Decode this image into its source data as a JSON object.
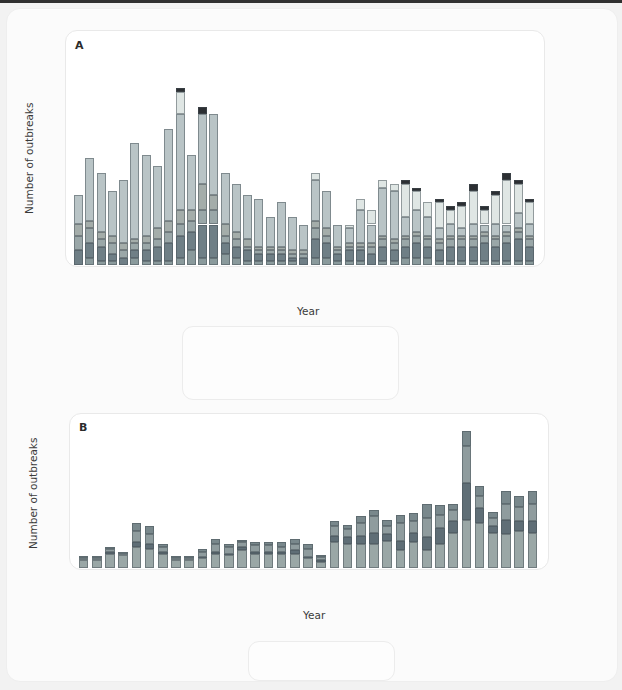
{
  "figure": {
    "background": "#f2f2f2",
    "panel_background": "#ffffff"
  },
  "panelA": {
    "letter": "A",
    "ylabel": "Number of outbreaks",
    "xlabel": "Year",
    "ytick_labels": [
      "0",
      "10",
      "20",
      "30",
      "40",
      "50",
      "60"
    ],
    "xtick_labels": [
      "1971",
      "1974",
      "1977",
      "1980",
      "1983",
      "1985",
      "1989",
      "1992",
      "1995",
      "1998",
      "2001",
      "2004",
      "2007",
      "2010"
    ],
    "legend": {
      "items": [
        {
          "label": "Parasitic",
          "color": "#8a9a9c",
          "italic": false
        },
        {
          "label": "Unidentified",
          "color": "#b9c4c6",
          "italic": false
        },
        {
          "label": "Bacterial",
          "color": "#6f7f86",
          "italic": false
        },
        {
          "label": "Legionella spp.",
          "color": "#dfe6e4",
          "italic": true
        },
        {
          "label": "Viral",
          "color": "#9aa7a8",
          "italic": false
        },
        {
          "label": "Multiple",
          "color": "#2c2f33",
          "italic": false
        },
        {
          "label": "Chemical",
          "color": "#a4adaa",
          "italic": false
        }
      ]
    }
  },
  "panelB": {
    "letter": "B",
    "ylabel": "Number of outbreaks",
    "xlabel": "Year",
    "ytick_labels": [
      "0",
      "10",
      "20",
      "30",
      "40",
      "50",
      "60",
      "70",
      "80",
      "90"
    ],
    "xtick_labels": [
      "1978",
      "1980",
      "1982",
      "1984",
      "1986",
      "1988",
      "1990",
      "1992",
      "1994",
      "1996",
      "1998",
      "2000",
      "2002",
      "2004",
      "2006",
      "2008",
      "2010",
      "2012"
    ],
    "legend": {
      "items": [
        {
          "label": "AGI",
          "sup": "",
          "color": "#9aa7a6"
        },
        {
          "label": "Other",
          "sup": "",
          "color": "#8f9c9e"
        },
        {
          "label": "ARI",
          "sup": "†",
          "color": "#5f6e76"
        },
        {
          "label": "Skin",
          "sup": "",
          "color": "#79888c"
        }
      ]
    }
  },
  "chart_data": [
    {
      "type": "bar",
      "id": "panel-A",
      "title": "A",
      "stacked": true,
      "xlabel": "Year",
      "ylabel": "Number of outbreaks",
      "ylim": [
        0,
        60
      ],
      "yticks": [
        0,
        10,
        20,
        30,
        40,
        50,
        60
      ],
      "grid": false,
      "legend_position": "below-plot",
      "series": [
        {
          "name": "Parasitic",
          "color": "#8a9a9c"
        },
        {
          "name": "Bacterial",
          "color": "#6f7f86"
        },
        {
          "name": "Viral",
          "color": "#9aa7a8"
        },
        {
          "name": "Chemical",
          "color": "#a4adaa"
        },
        {
          "name": "Unidentified",
          "color": "#b9c4c6"
        },
        {
          "name": "Legionella spp.",
          "color": "#dfe6e4"
        },
        {
          "name": "Multiple",
          "color": "#2c2f33"
        }
      ],
      "categories": [
        "1971",
        "1972",
        "1973",
        "1974",
        "1975",
        "1976",
        "1977",
        "1978",
        "1979",
        "1980",
        "1981",
        "1982",
        "1983",
        "1984",
        "1985",
        "1986",
        "1987",
        "1988",
        "1989",
        "1990",
        "1991",
        "1992",
        "1993",
        "1994",
        "1995",
        "1996",
        "1997",
        "1998",
        "1999",
        "2000",
        "2001",
        "2002",
        "2003",
        "2004",
        "2005",
        "2006",
        "2007",
        "2008",
        "2009",
        "2010",
        "2011"
      ],
      "stacks": {
        "Parasitic": [
          0,
          2,
          1,
          1,
          0,
          2,
          1,
          1,
          1,
          2,
          4,
          2,
          2,
          3,
          2,
          1,
          1,
          1,
          1,
          1,
          0,
          2,
          2,
          1,
          1,
          1,
          0,
          1,
          1,
          2,
          2,
          2,
          1,
          1,
          1,
          1,
          1,
          1,
          1,
          1,
          1
        ],
        "Bacterial": [
          4,
          4,
          4,
          2,
          2,
          2,
          3,
          4,
          5,
          6,
          5,
          9,
          9,
          3,
          3,
          3,
          2,
          2,
          2,
          1,
          2,
          5,
          4,
          2,
          3,
          3,
          3,
          4,
          3,
          3,
          4,
          3,
          3,
          4,
          4,
          4,
          5,
          4,
          5,
          6,
          4
        ],
        "Viral": [
          4,
          4,
          2,
          3,
          2,
          2,
          2,
          2,
          3,
          3,
          3,
          4,
          4,
          2,
          2,
          1,
          1,
          1,
          1,
          1,
          1,
          3,
          2,
          1,
          1,
          1,
          2,
          2,
          2,
          2,
          2,
          2,
          2,
          2,
          2,
          2,
          2,
          2,
          2,
          2,
          2
        ],
        "Chemical": [
          3,
          2,
          2,
          2,
          2,
          1,
          2,
          3,
          3,
          4,
          3,
          7,
          4,
          3,
          2,
          2,
          1,
          1,
          1,
          1,
          1,
          2,
          2,
          1,
          1,
          1,
          1,
          1,
          1,
          1,
          1,
          1,
          1,
          1,
          1,
          1,
          1,
          1,
          1,
          1,
          1
        ],
        "Unidentified": [
          8,
          17,
          16,
          12,
          17,
          26,
          22,
          17,
          25,
          26,
          15,
          19,
          22,
          14,
          13,
          12,
          13,
          8,
          12,
          9,
          7,
          11,
          10,
          6,
          4,
          9,
          5,
          13,
          13,
          5,
          6,
          5,
          3,
          3,
          2,
          3,
          2,
          3,
          2,
          4,
          3
        ],
        "Legionella spp.": [
          0,
          0,
          0,
          0,
          0,
          0,
          0,
          0,
          0,
          6,
          0,
          0,
          0,
          0,
          0,
          0,
          0,
          0,
          0,
          0,
          0,
          2,
          0,
          0,
          1,
          3,
          4,
          2,
          2,
          9,
          5,
          4,
          7,
          4,
          6,
          9,
          4,
          8,
          12,
          8,
          6
        ],
        "Multiple": [
          0,
          0,
          0,
          0,
          0,
          0,
          0,
          0,
          0,
          1,
          0,
          2,
          0,
          0,
          0,
          0,
          0,
          0,
          0,
          0,
          0,
          0,
          0,
          0,
          0,
          0,
          0,
          0,
          0,
          1,
          1,
          0,
          1,
          1,
          1,
          2,
          1,
          1,
          2,
          1,
          1
        ]
      },
      "totals": [
        19,
        29,
        25,
        20,
        23,
        33,
        30,
        27,
        37,
        48,
        30,
        43,
        41,
        25,
        22,
        19,
        18,
        14,
        16,
        15,
        11,
        25,
        20,
        11,
        11,
        18,
        15,
        23,
        22,
        23,
        21,
        17,
        18,
        16,
        17,
        22,
        16,
        20,
        25,
        23,
        18
      ]
    },
    {
      "type": "bar",
      "id": "panel-B",
      "title": "B",
      "stacked": true,
      "xlabel": "Year",
      "ylabel": "Number of outbreaks",
      "ylim": [
        0,
        90
      ],
      "yticks": [
        0,
        10,
        20,
        30,
        40,
        50,
        60,
        70,
        80,
        90
      ],
      "grid": false,
      "legend_position": "below-plot",
      "series": [
        {
          "name": "AGI",
          "color": "#9aa7a6"
        },
        {
          "name": "ARI",
          "color": "#5f6e76"
        },
        {
          "name": "Other",
          "color": "#8f9c9e"
        },
        {
          "name": "Skin",
          "color": "#79888c"
        }
      ],
      "categories": [
        "1978",
        "1979",
        "1980",
        "1981",
        "1982",
        "1983",
        "1984",
        "1985",
        "1986",
        "1987",
        "1988",
        "1989",
        "1990",
        "1991",
        "1992",
        "1993",
        "1994",
        "1995",
        "1996",
        "1997",
        "1998",
        "1999",
        "2000",
        "2001",
        "2002",
        "2003",
        "2004",
        "2005",
        "2006",
        "2007",
        "2008",
        "2009",
        "2010",
        "2011",
        "2012"
      ],
      "stacks": {
        "AGI": [
          5,
          5,
          9,
          8,
          13,
          12,
          9,
          5,
          5,
          6,
          9,
          8,
          11,
          9,
          9,
          9,
          9,
          6,
          4,
          16,
          15,
          15,
          15,
          17,
          11,
          16,
          11,
          15,
          22,
          30,
          28,
          22,
          21,
          23,
          22
        ],
        "ARI": [
          0,
          0,
          1,
          0,
          3,
          3,
          1,
          0,
          0,
          1,
          1,
          1,
          2,
          1,
          1,
          1,
          2,
          1,
          1,
          4,
          4,
          5,
          7,
          4,
          6,
          6,
          8,
          10,
          7,
          23,
          9,
          4,
          9,
          6,
          7
        ],
        "Other": [
          1,
          1,
          2,
          1,
          7,
          6,
          3,
          1,
          1,
          3,
          5,
          4,
          3,
          4,
          4,
          3,
          4,
          5,
          2,
          6,
          5,
          8,
          10,
          5,
          11,
          7,
          12,
          8,
          7,
          23,
          8,
          5,
          10,
          9,
          11
        ],
        "Skin": [
          1,
          1,
          1,
          1,
          5,
          5,
          2,
          1,
          1,
          2,
          3,
          2,
          1,
          2,
          2,
          3,
          3,
          3,
          1,
          3,
          3,
          4,
          4,
          4,
          5,
          5,
          9,
          6,
          4,
          9,
          6,
          4,
          8,
          7,
          8
        ]
      },
      "totals": [
        7,
        7,
        13,
        10,
        28,
        26,
        15,
        7,
        7,
        12,
        18,
        15,
        17,
        16,
        16,
        16,
        18,
        15,
        8,
        29,
        27,
        32,
        36,
        30,
        33,
        34,
        40,
        39,
        40,
        85,
        51,
        35,
        48,
        45,
        48
      ]
    }
  ]
}
